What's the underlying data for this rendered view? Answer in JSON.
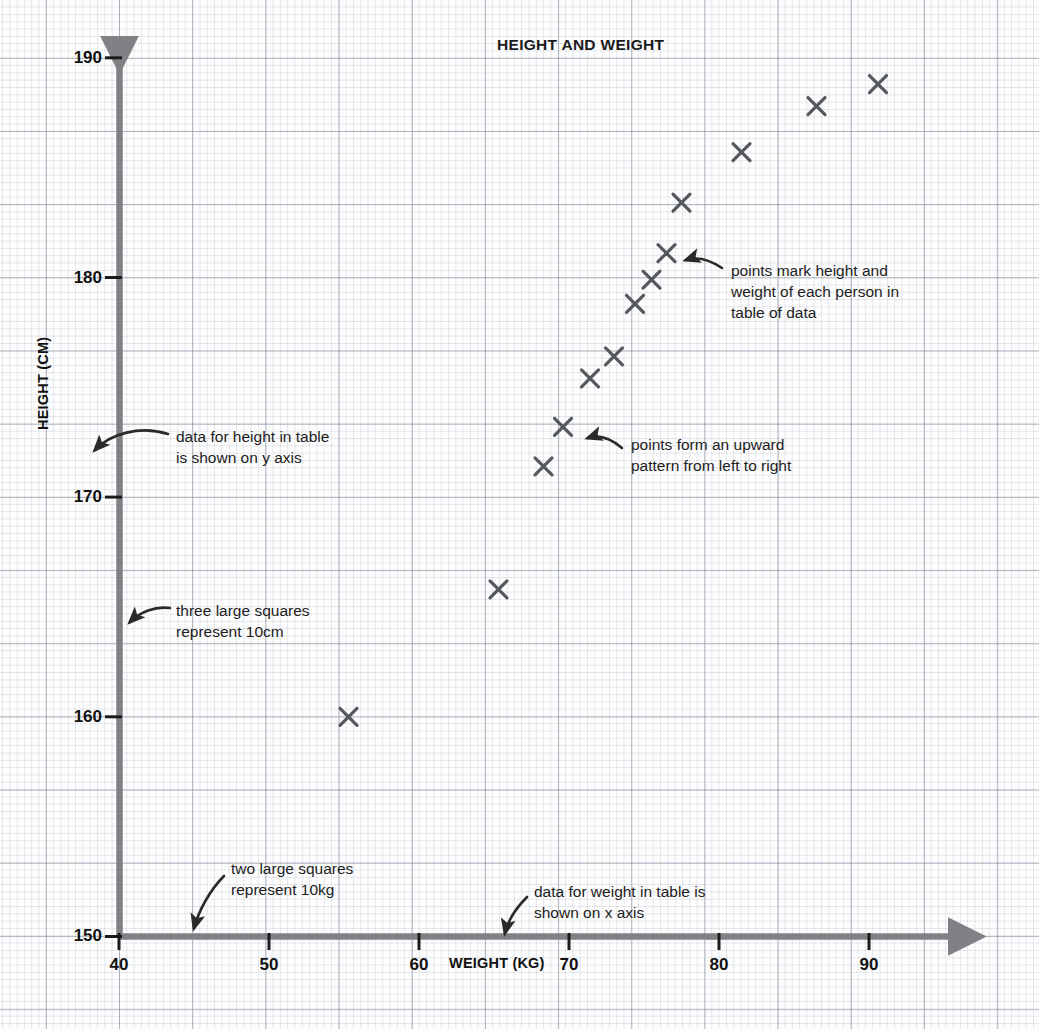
{
  "chart_data": {
    "type": "scatter",
    "title": "HEIGHT AND WEIGHT",
    "xlabel": "WEIGHT (KG)",
    "ylabel": "HEIGHT (CM)",
    "xlim": [
      40,
      95
    ],
    "ylim": [
      150,
      192
    ],
    "xticks": [
      40,
      50,
      60,
      70,
      80,
      90
    ],
    "yticks": [
      150,
      160,
      170,
      180,
      190
    ],
    "grid": true,
    "legend": null,
    "marker": "x",
    "marker_color": "#55595e",
    "x": [
      55.3,
      65.3,
      68.3,
      69.6,
      71.4,
      73.0,
      74.4,
      75.5,
      76.5,
      77.5,
      81.5,
      86.5,
      90.6
    ],
    "y": [
      160.0,
      165.8,
      171.4,
      173.2,
      175.4,
      176.4,
      178.8,
      179.9,
      181.1,
      183.4,
      185.7,
      187.8,
      188.8
    ],
    "points": [
      {
        "weight": 55.3,
        "height": 160.0
      },
      {
        "weight": 65.3,
        "height": 165.8
      },
      {
        "weight": 68.3,
        "height": 171.4
      },
      {
        "weight": 69.6,
        "height": 173.2
      },
      {
        "weight": 71.4,
        "height": 175.4
      },
      {
        "weight": 73.0,
        "height": 176.4
      },
      {
        "weight": 74.4,
        "height": 178.8
      },
      {
        "weight": 75.5,
        "height": 179.9
      },
      {
        "weight": 76.5,
        "height": 181.1
      },
      {
        "weight": 77.5,
        "height": 183.4
      },
      {
        "weight": 81.5,
        "height": 185.7
      },
      {
        "weight": 86.5,
        "height": 187.8
      },
      {
        "weight": 90.6,
        "height": 188.8
      }
    ]
  },
  "axes": {
    "y_tick_labels": [
      "190",
      "180",
      "170",
      "160",
      "150"
    ],
    "x_tick_labels": [
      "40",
      "50",
      "60",
      "70",
      "80",
      "90"
    ],
    "y_title": "HEIGHT (CM)",
    "x_title": "WEIGHT (KG)"
  },
  "annotations": {
    "points_mark": "points mark height and\nweight of each person in\ntable of data",
    "upward_pattern": "points form an upward\npattern from left to right",
    "height_on_y": "data for height in table\nis shown on y axis",
    "three_squares": "three large squares\nrepresent 10cm",
    "two_squares": "two large squares\nrepresent 10kg",
    "weight_on_x": "data for weight in table is\nshown on x axis"
  },
  "colors": {
    "axis": "#7f8184",
    "marker": "#55595e",
    "text": "#1b1b1b",
    "grid_fine": "#8c96aa",
    "grid_major": "#6e788c",
    "background": "#fdfdfd"
  }
}
